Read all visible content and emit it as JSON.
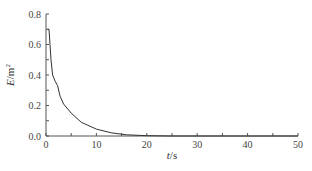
{
  "chart_data": {
    "type": "line",
    "title": "",
    "xlabel": "t/s",
    "ylabel": "E/m²",
    "xlabel_parts": {
      "var": "t",
      "unit": "/s"
    },
    "ylabel_parts": {
      "var": "E",
      "unit": "/m",
      "sup": "2"
    },
    "xlim": [
      0,
      50
    ],
    "ylim": [
      0,
      0.8
    ],
    "xticks": [
      0,
      10,
      20,
      30,
      40,
      50
    ],
    "xticks_minor": [
      5,
      15,
      25,
      35,
      45
    ],
    "yticks": [
      0.0,
      0.2,
      0.4,
      0.6,
      0.8
    ],
    "yticks_minor": [
      0.1,
      0.3,
      0.5,
      0.7
    ],
    "ytick_labels": [
      "0.0",
      "0.2",
      "0.4",
      "0.6",
      "0.8"
    ],
    "xtick_labels": [
      "0",
      "10",
      "20",
      "30",
      "40",
      "50"
    ],
    "grid": false,
    "legend": null,
    "series": [
      {
        "name": "E",
        "color": "#333333",
        "x": [
          0.3,
          0.6,
          0.8,
          1.0,
          1.3,
          1.8,
          2.3,
          2.8,
          3.5,
          5,
          7,
          10,
          13,
          16,
          20,
          25,
          50
        ],
        "y": [
          0.7,
          0.7,
          0.6,
          0.5,
          0.4,
          0.36,
          0.33,
          0.26,
          0.21,
          0.15,
          0.09,
          0.045,
          0.02,
          0.008,
          0.002,
          0.0,
          0.0
        ]
      }
    ]
  },
  "layout": {
    "plot_left": 46,
    "plot_right": 298,
    "plot_top": 14,
    "plot_bottom": 136
  }
}
